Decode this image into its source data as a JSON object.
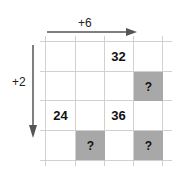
{
  "diagram": {
    "horizontal_step": {
      "label": "+6",
      "direction": "right"
    },
    "vertical_step": {
      "label": "+2",
      "direction": "down"
    },
    "grid": {
      "rows": 4,
      "cols": 4,
      "shade_color": "#a8a8a8",
      "line_color": "#d0d0d0",
      "cells": [
        {
          "row": 0,
          "col": 2,
          "value": "32",
          "shaded": false
        },
        {
          "row": 1,
          "col": 3,
          "value": "?",
          "shaded": true
        },
        {
          "row": 2,
          "col": 0,
          "value": "24",
          "shaded": false
        },
        {
          "row": 2,
          "col": 2,
          "value": "36",
          "shaded": false
        },
        {
          "row": 3,
          "col": 1,
          "value": "?",
          "shaded": true
        },
        {
          "row": 3,
          "col": 3,
          "value": "?",
          "shaded": true
        }
      ]
    }
  }
}
